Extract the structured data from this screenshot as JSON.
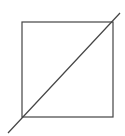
{
  "diagram": {
    "stroke_color": "#444444",
    "background": "#ffffff",
    "square": {
      "x": 22,
      "y": 22,
      "width": 91,
      "height": 95
    },
    "diagonal": {
      "x1": 8,
      "y1": 133,
      "x2": 120,
      "y2": 13
    }
  }
}
